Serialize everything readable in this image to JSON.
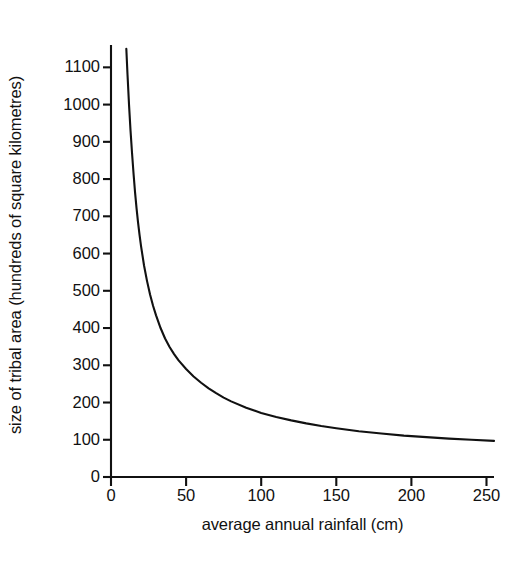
{
  "chart_data": {
    "type": "line",
    "title": "",
    "subtitle": "",
    "xlabel": "average annual rainfall (cm)",
    "ylabel": "size of tribal area (hundreds of square kilometres)",
    "xlim": [
      0,
      255
    ],
    "ylim": [
      0,
      1160
    ],
    "xticks": [
      0,
      50,
      100,
      150,
      200,
      250
    ],
    "xtick_labels": [
      "0",
      "50",
      "100",
      "150",
      "200",
      "250"
    ],
    "yticks": [
      0,
      100,
      200,
      300,
      400,
      500,
      600,
      700,
      800,
      900,
      1000,
      1100
    ],
    "ytick_labels": [
      "0",
      "100",
      "200",
      "300",
      "400",
      "500",
      "600",
      "700",
      "800",
      "900",
      "1000",
      "1100"
    ],
    "grid": false,
    "legend": null,
    "legend_position": "none",
    "annotations": [],
    "series": [
      {
        "name": "size of tribal area vs rainfall",
        "color": "#111111",
        "line_width": 2.1,
        "x": [
          10.2,
          11,
          12,
          13,
          14,
          15,
          16,
          17,
          18,
          19,
          20,
          22,
          24,
          26,
          28,
          30,
          33,
          36,
          39,
          42,
          45,
          50,
          55,
          60,
          65,
          70,
          75,
          80,
          90,
          100,
          110,
          120,
          130,
          140,
          150,
          165,
          180,
          195,
          210,
          225,
          240,
          255
        ],
        "y": [
          1150,
          1080,
          1000,
          930,
          870,
          815,
          765,
          722,
          684,
          650,
          620,
          568,
          526,
          490,
          460,
          434,
          400,
          372,
          349,
          330,
          313,
          290,
          270,
          253,
          238,
          225,
          213,
          203,
          186,
          172,
          161,
          152,
          144,
          137,
          131,
          123,
          117,
          111,
          107,
          103,
          100,
          97
        ]
      }
    ]
  },
  "axis_geometry": {
    "plot_left_px": 111,
    "plot_right_px": 494,
    "plot_top_px": 45,
    "plot_bottom_px": 477
  }
}
